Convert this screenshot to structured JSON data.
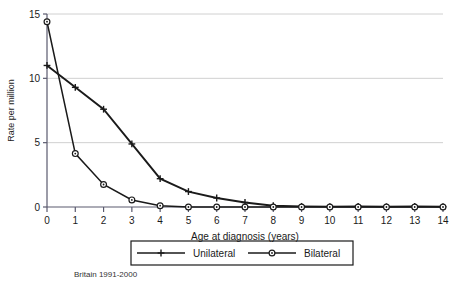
{
  "chart_data": {
    "type": "line",
    "title": "",
    "subtitle": "",
    "xlabel": "Age at diagnosis (years)",
    "ylabel": "Rate per million",
    "caption": "Britain 1991-2000",
    "x": [
      0,
      1,
      2,
      3,
      4,
      5,
      6,
      7,
      8,
      9,
      10,
      11,
      12,
      13,
      14
    ],
    "xticklabels": [
      "0",
      "1",
      "2",
      "3",
      "4",
      "5",
      "6",
      "7",
      "8",
      "9",
      "10",
      "11",
      "12",
      "13",
      "14"
    ],
    "yticklabels": [
      "0",
      "5",
      "10",
      "15"
    ],
    "yticks": [
      0,
      5,
      10,
      15
    ],
    "xlim": [
      0,
      14
    ],
    "ylim": [
      0,
      15
    ],
    "grid": "horizontal",
    "legend_position": "bottom",
    "series": [
      {
        "name": "Unilateral",
        "marker": "plus",
        "color": "#1a1a1a",
        "values": [
          11.0,
          9.3,
          7.6,
          4.9,
          2.2,
          1.2,
          0.7,
          0.35,
          0.1,
          0.05,
          0.03,
          0.05,
          0.02,
          0.05,
          0.02
        ]
      },
      {
        "name": "Bilateral",
        "marker": "circle",
        "color": "#1a1a1a",
        "values": [
          14.4,
          4.15,
          1.75,
          0.55,
          0.1,
          0.0,
          0.0,
          0.0,
          0.0,
          0.0,
          0.0,
          0.0,
          0.0,
          0.0,
          0.0
        ]
      }
    ]
  },
  "legend": {
    "items": [
      {
        "label": "Unilateral"
      },
      {
        "label": "Bilateral"
      }
    ]
  },
  "axes": {
    "y_title": "Rate per million",
    "x_title": "Age at diagnosis (years)"
  },
  "footer": {
    "source_note": "Britain 1991-2000"
  }
}
